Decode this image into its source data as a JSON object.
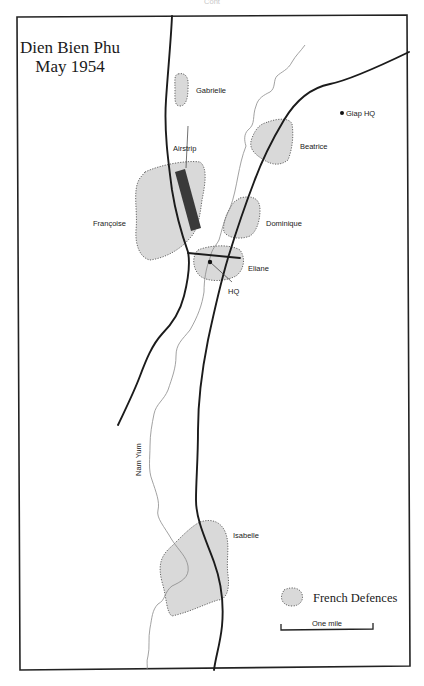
{
  "header": {
    "cropped_text": "Cont"
  },
  "map": {
    "title_line1": "Dien Bien Phu",
    "title_line2": "May 1954",
    "positions": [
      {
        "name": "Gabrielle"
      },
      {
        "name": "Beatrice"
      },
      {
        "name": "Airstrip"
      },
      {
        "name": "Françoise"
      },
      {
        "name": "Dominique"
      },
      {
        "name": "Eliane"
      },
      {
        "name": "HQ"
      },
      {
        "name": "Isabelle"
      }
    ],
    "enemy": {
      "name": "Giap HQ"
    },
    "river": {
      "name": "Nam Yum"
    },
    "legend": {
      "defences_label": "French Defences"
    },
    "scale": {
      "label": "One mile"
    },
    "colors": {
      "defence_fill": "#d9d9d9",
      "airstrip": "#3a3a3a",
      "road": "#1b1b1b",
      "river": "#8a8a8a"
    }
  }
}
